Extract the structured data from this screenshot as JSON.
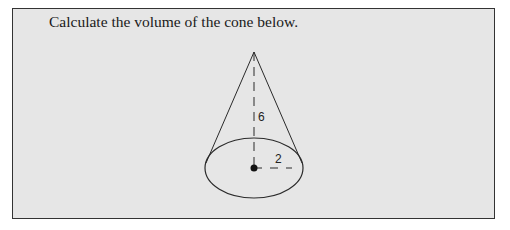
{
  "question": {
    "text": "Calculate the volume of the cone below."
  },
  "figure": {
    "type": "cone",
    "height_label": "6",
    "radius_label": "2",
    "stroke_color": "#2a2a2a",
    "background_color": "#e6e6e6"
  }
}
